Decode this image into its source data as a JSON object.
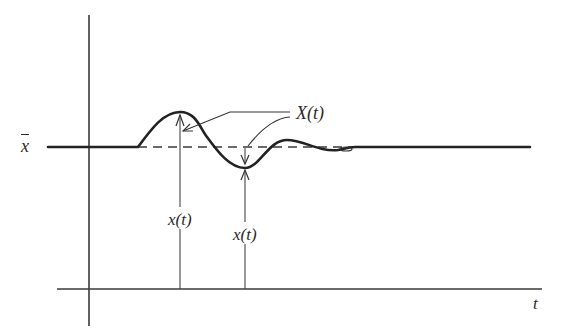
{
  "figure": {
    "type": "response-diagram",
    "colors": {
      "ink": "#2a2a2a",
      "background": "#ffffff"
    },
    "labels": {
      "mean_level": "x",
      "envelope_label": "X(t)",
      "value_label_peak": "x(t)",
      "value_label_trough": "x(t)",
      "time_axis": "t"
    },
    "curve": {
      "description": "Step-like signal at mean level x̄ with a damped oscillation: rises to a peak, dips to a trough, small overshoot, then settles back to x̄",
      "baseline_y": 147,
      "points": [
        [
          48,
          147
        ],
        [
          138,
          147
        ],
        [
          180,
          112
        ],
        [
          207,
          140
        ],
        [
          245,
          168
        ],
        [
          287,
          140
        ],
        [
          338,
          150
        ],
        [
          355,
          147
        ],
        [
          530,
          147
        ]
      ]
    },
    "annotations": [
      {
        "name": "peak-arrow",
        "from_x": 180,
        "from_y": 289,
        "to_y": 112
      },
      {
        "name": "trough-arrow",
        "from_x": 245,
        "from_y": 289,
        "to_y": 168
      },
      {
        "name": "envelope-leader-peak",
        "target": [
          180,
          131
        ]
      },
      {
        "name": "envelope-leader-trough",
        "target": [
          245,
          147
        ]
      }
    ]
  }
}
